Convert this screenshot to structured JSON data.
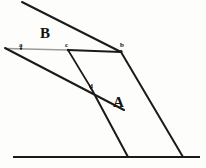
{
  "figure": {
    "type": "line-diagram",
    "width": 206,
    "height": 168,
    "background_color": "#fdfdfc",
    "ink_color": "#1a1a1a",
    "faded_ink_color": "#8d8d8d",
    "region_labels": [
      {
        "id": "B",
        "text": "B",
        "x": 40,
        "y": 26
      },
      {
        "id": "A",
        "text": "A",
        "x": 113,
        "y": 95
      }
    ],
    "point_labels": [
      {
        "id": "a",
        "text": "a",
        "x": 19,
        "y": 42
      },
      {
        "id": "c",
        "text": "c",
        "x": 65,
        "y": 42
      },
      {
        "id": "b",
        "text": "b",
        "x": 120,
        "y": 42
      },
      {
        "id": "d",
        "text": "d",
        "x": 89,
        "y": 83
      }
    ],
    "vertices": {
      "top_line_start": {
        "x": 22,
        "y": 2
      },
      "a": {
        "x": 5,
        "y": 48
      },
      "c": {
        "x": 68,
        "y": 50
      },
      "b": {
        "x": 121,
        "y": 52
      },
      "d": {
        "x": 90,
        "y": 88
      },
      "baseline_left": {
        "x": 13,
        "y": 157
      },
      "baseline_right": {
        "x": 200,
        "y": 157
      },
      "foot_mid": {
        "x": 128,
        "y": 157
      },
      "foot_right": {
        "x": 183,
        "y": 157
      },
      "left_ray_end": {
        "x": 124,
        "y": 110
      }
    },
    "strokes": [
      {
        "name": "top-oblique-line",
        "from": "top_line_start",
        "to": "b",
        "style": "solid",
        "weight": 2.0
      },
      {
        "name": "horizontal-line-faded-ac",
        "from": "a",
        "to": "c",
        "style": "faded",
        "weight": 1.6
      },
      {
        "name": "horizontal-line-cb",
        "from": "c",
        "to": "b",
        "style": "solid",
        "weight": 1.8
      },
      {
        "name": "left-oblique-line",
        "from": "a",
        "to": "left_ray_end",
        "style": "solid",
        "weight": 2.0
      },
      {
        "name": "line-c-to-d",
        "from": "c",
        "to": "d",
        "style": "solid",
        "weight": 1.6
      },
      {
        "name": "line-d-to-baseline",
        "from": "d",
        "to": "foot_mid",
        "style": "solid",
        "weight": 2.0
      },
      {
        "name": "line-b-to-baseline",
        "from": "b",
        "to": "foot_right",
        "style": "solid",
        "weight": 2.0
      },
      {
        "name": "baseline",
        "from": "baseline_left",
        "to": "baseline_right",
        "style": "solid",
        "weight": 2.0
      }
    ]
  }
}
